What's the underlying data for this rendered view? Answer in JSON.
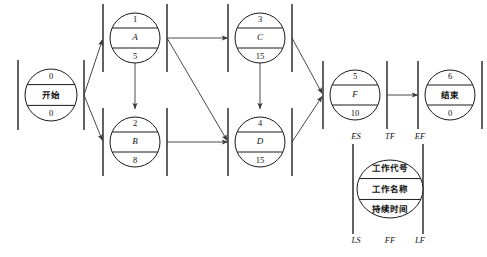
{
  "diagram": {
    "type": "precedence-network-diagram",
    "canvas": {
      "width": 487,
      "height": 257
    },
    "style": {
      "stroke": "#1a1a1a",
      "edge_stroke": "#4a4a4a",
      "gate_stroke": "#3a3a3a",
      "background": "#ffffff"
    },
    "nodes": [
      {
        "id": "start",
        "code": "0",
        "name": "开始",
        "duration": "0",
        "name_italic": false,
        "cx": 51,
        "cy": 95,
        "r": 26
      },
      {
        "id": "A",
        "code": "1",
        "name": "A",
        "duration": "5",
        "name_italic": true,
        "cx": 135,
        "cy": 38,
        "r": 25
      },
      {
        "id": "B",
        "code": "2",
        "name": "B",
        "duration": "8",
        "name_italic": true,
        "cx": 135,
        "cy": 142,
        "r": 25
      },
      {
        "id": "C",
        "code": "3",
        "name": "C",
        "duration": "15",
        "name_italic": true,
        "cx": 260,
        "cy": 38,
        "r": 25
      },
      {
        "id": "D",
        "code": "4",
        "name": "D",
        "duration": "15",
        "name_italic": true,
        "cx": 260,
        "cy": 142,
        "r": 25
      },
      {
        "id": "F",
        "code": "5",
        "name": "F",
        "duration": "10",
        "name_italic": true,
        "cx": 355,
        "cy": 95,
        "r": 25
      },
      {
        "id": "end",
        "code": "6",
        "name": "结束",
        "duration": "0",
        "name_italic": false,
        "cx": 450,
        "cy": 95,
        "r": 25
      }
    ],
    "edges": [
      {
        "from": "start",
        "to": "A"
      },
      {
        "from": "start",
        "to": "B"
      },
      {
        "from": "A",
        "to": "B"
      },
      {
        "from": "A",
        "to": "C"
      },
      {
        "from": "A",
        "to": "D"
      },
      {
        "from": "B",
        "to": "D"
      },
      {
        "from": "C",
        "to": "D"
      },
      {
        "from": "C",
        "to": "F"
      },
      {
        "from": "D",
        "to": "F"
      },
      {
        "from": "F",
        "to": "end"
      }
    ]
  },
  "legend": {
    "top_labels": [
      "ES",
      "TF",
      "EF"
    ],
    "bottom_labels": [
      "LS",
      "FF",
      "LF"
    ],
    "rows": [
      "工作代号",
      "工作名称",
      "持续时间"
    ],
    "cx": 390,
    "cy": 189,
    "rx": 33,
    "ry": 29,
    "bar_left_x": 353,
    "bar_right_x": 423
  }
}
